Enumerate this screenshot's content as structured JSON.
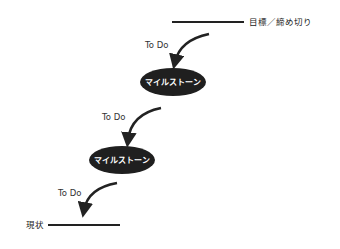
{
  "diagram": {
    "goal_label": "目標／締め切り",
    "current_label": "現状",
    "steps": [
      {
        "todo_label": "To Do"
      },
      {
        "todo_label": "To Do"
      },
      {
        "todo_label": "To Do"
      }
    ],
    "milestones": [
      {
        "label": "マイルストーン"
      },
      {
        "label": "マイルストーン"
      }
    ],
    "colors": {
      "line": "#222222",
      "milestone_fill": "#1f1f1f",
      "milestone_text": "#ffffff",
      "text": "#333333"
    }
  }
}
